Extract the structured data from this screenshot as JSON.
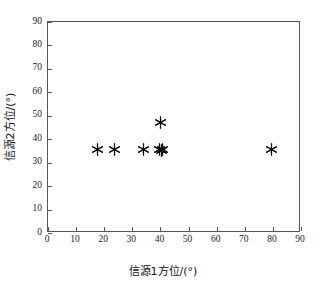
{
  "chart_data": {
    "type": "scatter",
    "title": "",
    "xlabel": "信源1方位/(°)",
    "ylabel": "信源2方位/(°)",
    "xlim": [
      0,
      90
    ],
    "ylim": [
      0,
      90
    ],
    "xticks": [
      0,
      10,
      20,
      30,
      40,
      50,
      60,
      70,
      80,
      90
    ],
    "yticks": [
      0,
      10,
      20,
      30,
      40,
      50,
      60,
      70,
      80,
      90
    ],
    "xtick_labels": [
      "0",
      "10",
      "20",
      "30",
      "40",
      "50",
      "60",
      "70",
      "80",
      "90"
    ],
    "ytick_labels": [
      "0",
      "10",
      "20",
      "30",
      "40",
      "50",
      "60",
      "70",
      "80",
      "90"
    ],
    "grid": false,
    "legend": null,
    "marker": "asterisk",
    "marker_color": "#0a0a0a",
    "series": [
      {
        "name": "估计结果",
        "points": [
          {
            "x": 17.5,
            "y": 35.5
          },
          {
            "x": 23.5,
            "y": 35.5
          },
          {
            "x": 34.0,
            "y": 35.5
          },
          {
            "x": 39.5,
            "y": 35.5
          },
          {
            "x": 40.3,
            "y": 35.2
          },
          {
            "x": 40.8,
            "y": 35.8
          },
          {
            "x": 40.0,
            "y": 47.0
          },
          {
            "x": 79.5,
            "y": 35.5
          }
        ]
      }
    ]
  },
  "axes": {
    "x_title": "信源1方位/(°)",
    "y_title": "信源2方位/(°)"
  }
}
